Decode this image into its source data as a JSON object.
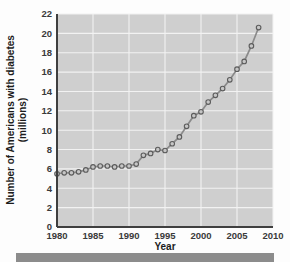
{
  "chart_data": {
    "type": "line",
    "title": "",
    "xlabel": "Year",
    "ylabel": "Number of Americans with diabetes (millions)",
    "ylabel_line1": "Number of Americans with diabetes",
    "ylabel_line2": "(millions)",
    "xlim": [
      1980,
      2010
    ],
    "ylim": [
      0,
      22
    ],
    "xticks": [
      1980,
      1985,
      1990,
      1995,
      2000,
      2005,
      2010
    ],
    "yticks": [
      0,
      2,
      4,
      6,
      8,
      10,
      12,
      14,
      16,
      18,
      20,
      22
    ],
    "grid": true,
    "legend": "none",
    "marker": "open-circle",
    "series": [
      {
        "name": "Americans with diabetes",
        "x": [
          1980,
          1981,
          1982,
          1983,
          1984,
          1985,
          1986,
          1987,
          1988,
          1989,
          1990,
          1991,
          1992,
          1993,
          1994,
          1995,
          1996,
          1997,
          1998,
          1999,
          2000,
          2001,
          2002,
          2003,
          2004,
          2005,
          2006,
          2007,
          2008
        ],
        "values": [
          5.5,
          5.6,
          5.6,
          5.7,
          5.9,
          6.2,
          6.3,
          6.3,
          6.2,
          6.3,
          6.3,
          6.5,
          7.4,
          7.6,
          8.0,
          7.9,
          8.6,
          9.3,
          10.4,
          11.5,
          11.9,
          12.9,
          13.6,
          14.3,
          15.2,
          16.3,
          17.1,
          18.7,
          20.6
        ]
      }
    ],
    "colors": {
      "plot_background": "#cfcfcf",
      "gridline": "#f2f2f2",
      "line": "#8a8a8a",
      "marker_fill": "#c6c6c6",
      "marker_edge": "#5c5c5c",
      "axis": "#3f3f3f",
      "text": "#1c1c1c",
      "footer_bar": "#8c8c8c"
    },
    "geometry": {
      "plot_left": 57,
      "plot_right": 273,
      "plot_top": 14,
      "plot_bottom": 227
    }
  },
  "footer": {
    "bar_label": ""
  }
}
